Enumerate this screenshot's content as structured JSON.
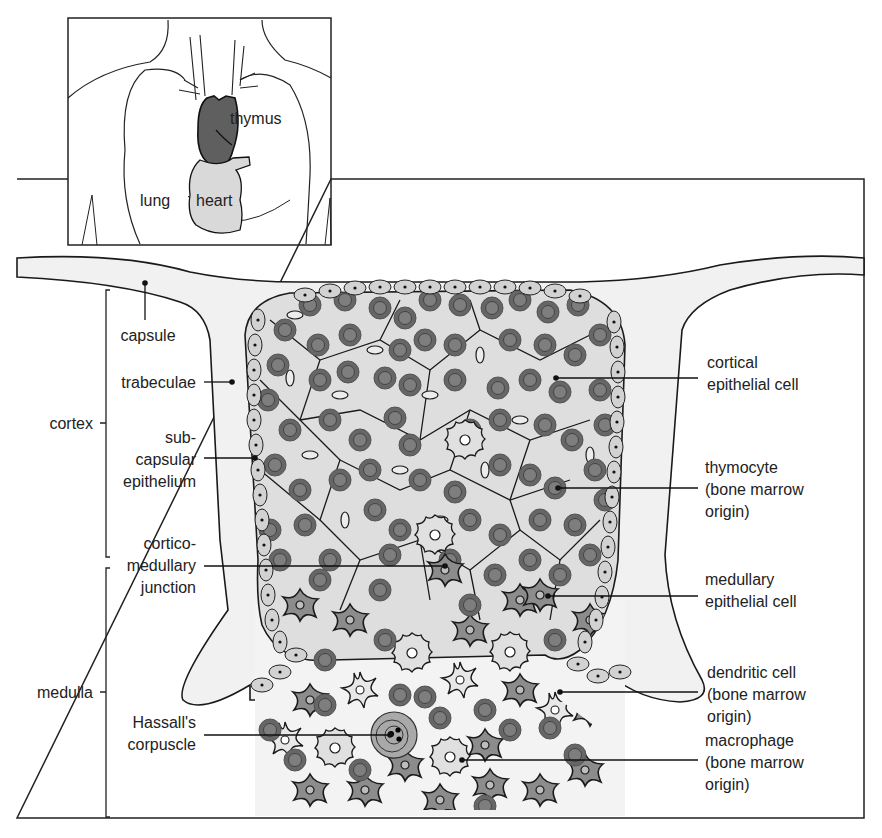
{
  "inset": {
    "labels": {
      "thymus": "thymus",
      "lung": "lung",
      "heart": "heart"
    },
    "colors": {
      "thymus_fill": "#5f5f5f",
      "heart_fill": "#d9d9d9"
    }
  },
  "main": {
    "colors": {
      "capsule_fill": "#f1f1f1",
      "cortex_fill": "#dcdcdc",
      "thymocyte_outer": "#6b6b6b",
      "thymocyte_inner": "#7d7d7d",
      "epithelial_fill": "#bdbdbd",
      "medullary_epithelial_fill": "#8a8a8a",
      "outline": "#1a1a1a"
    },
    "regions": {
      "cortex": "cortex",
      "medulla": "medulla"
    },
    "left_labels": {
      "capsule": "capsule",
      "trabeculae": "trabeculae",
      "subcapsular": [
        "sub-",
        "capsular",
        "epithelium"
      ],
      "corticomedullary": [
        "cortico-",
        "medullary",
        "junction"
      ],
      "hassalls": [
        "Hassall's",
        "corpuscle"
      ]
    },
    "right_labels": {
      "cortical_epithelial": [
        "cortical",
        "epithelial  cell"
      ],
      "thymocyte": [
        "thymocyte",
        "(bone  marrow",
        "origin)"
      ],
      "medullary_epithelial": [
        "medullary",
        "epithelial  cell"
      ],
      "dendritic": [
        "dendritic  cell",
        "(bone  marrow",
        "origin)"
      ],
      "macrophage": [
        "macrophage",
        "(bone  marrow",
        "origin)"
      ]
    }
  }
}
